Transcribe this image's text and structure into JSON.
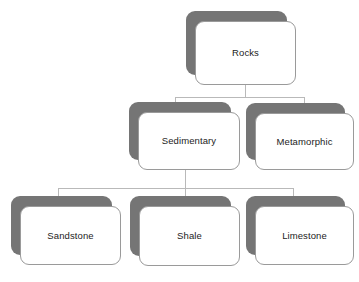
{
  "diagram": {
    "type": "hierarchy-tree",
    "colors": {
      "shadow": "#757575",
      "card_fill": "#ffffff",
      "card_border": "#9a9a9a",
      "connector": "#b9b9b9",
      "text": "#1c1c1c",
      "background": "#ffffff"
    },
    "nodes": [
      {
        "id": "rocks",
        "label": "Rocks",
        "level": 1
      },
      {
        "id": "sedimentary",
        "label": "Sedimentary",
        "level": 2
      },
      {
        "id": "metamorphic",
        "label": "Metamorphic",
        "level": 2
      },
      {
        "id": "sandstone",
        "label": "Sandstone",
        "level": 3
      },
      {
        "id": "shale",
        "label": "Shale",
        "level": 3
      },
      {
        "id": "limestone",
        "label": "Limestone",
        "level": 3
      }
    ],
    "edges": [
      {
        "from": "rocks",
        "to": "sedimentary"
      },
      {
        "from": "rocks",
        "to": "metamorphic"
      },
      {
        "from": "sedimentary",
        "to": "sandstone"
      },
      {
        "from": "sedimentary",
        "to": "shale"
      },
      {
        "from": "sedimentary",
        "to": "limestone"
      }
    ]
  }
}
